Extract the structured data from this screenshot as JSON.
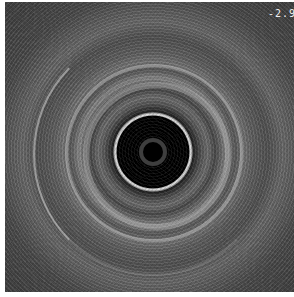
{
  "image": {
    "type": "intravascular ultrasound cross-section",
    "scale_label": "-2.9",
    "colors": {
      "lumen": "#000000",
      "lumen_border": "#f2f2f2",
      "tissue": "#5a5a5a",
      "frame": "#ffffff"
    }
  }
}
